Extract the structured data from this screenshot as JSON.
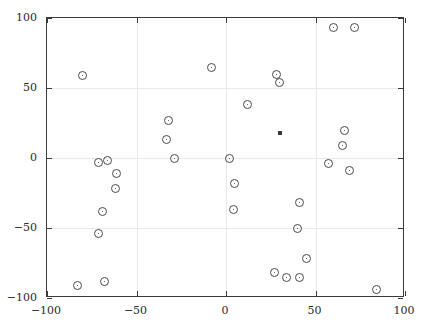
{
  "chart_data": {
    "type": "scatter",
    "title": "",
    "subtitle": "",
    "xlabel": "",
    "ylabel": "",
    "xlim": [
      -100,
      100
    ],
    "ylim": [
      -100,
      100
    ],
    "xticks": [
      -100,
      -50,
      0,
      50,
      100
    ],
    "yticks": [
      -100,
      -50,
      0,
      50,
      100
    ],
    "xtick_labels": [
      "-100",
      "-50",
      "0",
      "50",
      "100"
    ],
    "ytick_labels": [
      "-100",
      "-50",
      "0",
      "50",
      "100"
    ],
    "grid": true,
    "grid_color": "#e9e9ea",
    "legend": null,
    "legend_position": "none",
    "axis_color": "#3a3a3a",
    "background_color": "#ffffff",
    "series": [
      {
        "name": "data-points",
        "marker": "circle-open",
        "marker_color": "#4a4a4a",
        "points": [
          {
            "x": -80,
            "y": 59
          },
          {
            "x": -71,
            "y": -3
          },
          {
            "x": -66,
            "y": -2
          },
          {
            "x": -61,
            "y": -11
          },
          {
            "x": -62,
            "y": -22
          },
          {
            "x": -69,
            "y": -38
          },
          {
            "x": -71,
            "y": -54
          },
          {
            "x": -83,
            "y": -91
          },
          {
            "x": -68,
            "y": -88
          },
          {
            "x": -32,
            "y": 27
          },
          {
            "x": -33,
            "y": 13
          },
          {
            "x": -29,
            "y": 0
          },
          {
            "x": -8,
            "y": 65
          },
          {
            "x": 2,
            "y": 0
          },
          {
            "x": 5,
            "y": -18
          },
          {
            "x": 4,
            "y": -37
          },
          {
            "x": 12,
            "y": 38
          },
          {
            "x": 28,
            "y": 60
          },
          {
            "x": 30,
            "y": 54
          },
          {
            "x": 41,
            "y": -32
          },
          {
            "x": 40,
            "y": -50
          },
          {
            "x": 45,
            "y": -72
          },
          {
            "x": 27,
            "y": -82
          },
          {
            "x": 34,
            "y": -85
          },
          {
            "x": 41,
            "y": -85
          },
          {
            "x": 60,
            "y": 93
          },
          {
            "x": 72,
            "y": 93
          },
          {
            "x": 66,
            "y": 20
          },
          {
            "x": 65,
            "y": 9
          },
          {
            "x": 57,
            "y": -4
          },
          {
            "x": 69,
            "y": -9
          },
          {
            "x": 84,
            "y": -94
          }
        ]
      },
      {
        "name": "centroid",
        "marker": "square-filled",
        "marker_color": "#3a3a3a",
        "points": [
          {
            "x": 30,
            "y": 18
          }
        ]
      }
    ]
  }
}
